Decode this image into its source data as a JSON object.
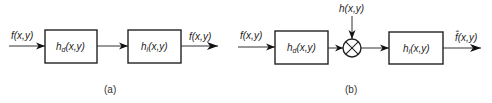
{
  "panel_a": {
    "caption": "(a)",
    "input_label": "f(x,y)",
    "block1_label": "hd(x,y)",
    "block1_main": "h",
    "block1_sub": "d",
    "block1_args": "(x,y)",
    "block2_label": "hi(x,y)",
    "block2_main": "h",
    "block2_sub": "i",
    "block2_args": "(x,y)",
    "output_label": "f(x,y)"
  },
  "panel_b": {
    "caption": "(b)",
    "input_label": "f(x,y)",
    "block1_main": "h",
    "block1_sub": "d",
    "block1_args": "(x,y)",
    "multiplier_input_label": "h(x,y)",
    "multiplier_symbol": "multiply-circle",
    "block2_main": "h",
    "block2_sub": "i",
    "block2_args": "(x,y)",
    "output_label": "f̂(x,y)"
  },
  "colors": {
    "line": "#222222",
    "background": "#ffffff"
  }
}
